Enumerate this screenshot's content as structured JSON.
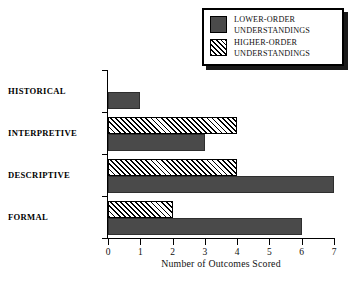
{
  "chart_data": {
    "type": "bar",
    "orientation": "horizontal",
    "title": "",
    "xlabel": "Number of Outcomes Scored",
    "ylabel": "",
    "xlim": [
      0,
      7
    ],
    "xticks": [
      "0",
      "1",
      "2",
      "3",
      "4",
      "5",
      "6",
      "7"
    ],
    "grid": false,
    "legend_position": "top-right",
    "categories": [
      "HISTORICAL",
      "INTERPRETIVE",
      "DESCRIPTIVE",
      "FORMAL"
    ],
    "series": [
      {
        "name": "LOWER-ORDER UNDERSTANDINGS",
        "values": [
          1,
          3,
          7,
          6
        ],
        "fill": "solid",
        "color": "#4a4a4a"
      },
      {
        "name": "HIGHER-ORDER UNDERSTANDINGS",
        "values": [
          0,
          4,
          4,
          2
        ],
        "fill": "diagonal-hatch",
        "color": "#ffffff"
      }
    ]
  },
  "legend": {
    "items": [
      {
        "swatch": "solid-square",
        "line1": "LOWER-ORDER",
        "line2": "UNDERSTANDINGS"
      },
      {
        "swatch": "hatched-square",
        "line1": "HIGHER-ORDER",
        "line2": "UNDERSTANDINGS"
      }
    ]
  },
  "axis": {
    "x_title": "Number of Outcomes Scored",
    "x_tick_labels": [
      "0",
      "1",
      "2",
      "3",
      "4",
      "5",
      "6",
      "7"
    ],
    "category_labels": [
      "HISTORICAL",
      "INTERPRETIVE",
      "DESCRIPTIVE",
      "FORMAL"
    ]
  }
}
